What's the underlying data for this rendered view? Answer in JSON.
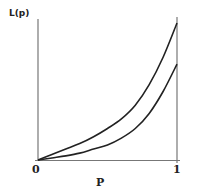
{
  "chart_data": {
    "type": "line",
    "title": "",
    "xlabel": "P",
    "ylabel": "L(p)",
    "x_ticks": [
      "0",
      "1"
    ],
    "xlim": [
      0,
      1
    ],
    "ylim": [
      0,
      1.05
    ],
    "grid": false,
    "legend": null,
    "annotations": [
      "vertical reference line at p = 1"
    ],
    "series": [
      {
        "name": "upper curve",
        "x": [
          0,
          0.1,
          0.2,
          0.3,
          0.4,
          0.5,
          0.6,
          0.7,
          0.8,
          0.9,
          1.0
        ],
        "y": [
          0,
          0.04,
          0.08,
          0.12,
          0.17,
          0.23,
          0.3,
          0.4,
          0.55,
          0.75,
          1.0
        ]
      },
      {
        "name": "lower curve",
        "x": [
          0,
          0.1,
          0.2,
          0.3,
          0.4,
          0.5,
          0.6,
          0.7,
          0.8,
          0.9,
          1.0
        ],
        "y": [
          0,
          0.015,
          0.03,
          0.05,
          0.08,
          0.11,
          0.16,
          0.23,
          0.34,
          0.5,
          0.7
        ]
      }
    ]
  },
  "labels": {
    "ylabel": "L(p)",
    "xlabel": "P",
    "tick_0": "0",
    "tick_1": "1"
  }
}
